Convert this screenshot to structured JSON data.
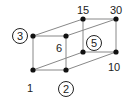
{
  "diagram": {
    "type": "divisor-lattice-cube",
    "nodes": [
      {
        "id": "n1",
        "label": "1",
        "x": 33,
        "y": 70,
        "lx": 30,
        "ly": 88
      },
      {
        "id": "n2",
        "label": "2",
        "x": 66,
        "y": 70,
        "circled": true,
        "lx": 66,
        "ly": 89
      },
      {
        "id": "n3",
        "label": "3",
        "x": 33,
        "y": 36,
        "circled": true,
        "lx": 20,
        "ly": 36
      },
      {
        "id": "n6",
        "label": "6",
        "x": 66,
        "y": 36,
        "lx": 59,
        "ly": 48
      },
      {
        "id": "n5",
        "label": "5",
        "x": 83,
        "y": 52,
        "circled": true,
        "lx": 94,
        "ly": 43
      },
      {
        "id": "n10",
        "label": "10",
        "x": 116,
        "y": 52,
        "lx": 114,
        "ly": 67
      },
      {
        "id": "n15",
        "label": "15",
        "x": 83,
        "y": 19,
        "lx": 83,
        "ly": 10
      },
      {
        "id": "n30",
        "label": "30",
        "x": 116,
        "y": 19,
        "lx": 116,
        "ly": 10
      }
    ],
    "edges": [
      [
        "n1",
        "n2"
      ],
      [
        "n1",
        "n3"
      ],
      [
        "n2",
        "n6"
      ],
      [
        "n3",
        "n6"
      ],
      [
        "n5",
        "n10"
      ],
      [
        "n5",
        "n15"
      ],
      [
        "n10",
        "n30"
      ],
      [
        "n15",
        "n30"
      ],
      [
        "n1",
        "n5"
      ],
      [
        "n2",
        "n10"
      ],
      [
        "n3",
        "n15"
      ],
      [
        "n6",
        "n30"
      ]
    ],
    "colors": {
      "line": "#888888",
      "node": "#111111",
      "text": "#222222"
    }
  }
}
